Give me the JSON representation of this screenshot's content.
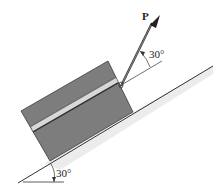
{
  "figure": {
    "force_label": "P",
    "force_angle_label": "30°",
    "incline_angle_label": "30°",
    "colors": {
      "box_fill": "#7d7d7d",
      "box_edge": "#3a3a3a",
      "stripe_light": "#d8d8d8",
      "stripe_dark": "#2e2e2e",
      "incline_shade": "#ececec",
      "line": "#333333"
    }
  }
}
